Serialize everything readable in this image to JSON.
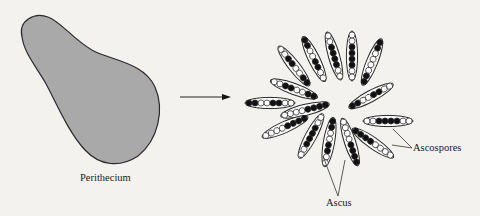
{
  "diagram": {
    "colors": {
      "background": "#f3f2ef",
      "perithecium_fill": "#a9a9a9",
      "outline": "#2a2a2a",
      "spore_dark": "#111111",
      "spore_light": "#ffffff"
    },
    "perithecium": {
      "label": "Perithecium"
    },
    "arrow": {
      "from": [
        180,
        97
      ],
      "to": [
        230,
        97
      ]
    },
    "labels": {
      "ascospores": "Ascospores",
      "ascus": "Ascus"
    },
    "asci": [
      {
        "id": "A",
        "cx": 294,
        "cy": 66,
        "angle": 52,
        "pattern": "WWBBWWBB"
      },
      {
        "id": "B",
        "cx": 314,
        "cy": 59,
        "angle": 64,
        "pattern": "BBWWBBWW"
      },
      {
        "id": "C",
        "cx": 334,
        "cy": 56,
        "angle": 74,
        "pattern": "WWBBBBWW"
      },
      {
        "id": "D",
        "cx": 352,
        "cy": 56,
        "angle": 90,
        "pattern": "WWBBBBWW"
      },
      {
        "id": "E",
        "cx": 372,
        "cy": 62,
        "angle": 112,
        "pattern": "BBWWWWBB"
      },
      {
        "id": "F",
        "cx": 294,
        "cy": 89,
        "angle": 20,
        "pattern": "WWBBWWBB"
      },
      {
        "id": "G",
        "cx": 270,
        "cy": 103,
        "angle": 0,
        "pattern": "BBWWBBWW"
      },
      {
        "id": "H",
        "cx": 305,
        "cy": 110,
        "angle": -14,
        "pattern": "WWWWBBBB"
      },
      {
        "id": "I",
        "cx": 285,
        "cy": 127,
        "angle": -24,
        "pattern": "WWWWBBBB"
      },
      {
        "id": "J",
        "cx": 311,
        "cy": 136,
        "angle": -62,
        "pattern": "WWBBBBWW"
      },
      {
        "id": "K",
        "cx": 329,
        "cy": 142,
        "angle": -80,
        "pattern": "WWBBWWBB"
      },
      {
        "id": "L",
        "cx": 350,
        "cy": 142,
        "angle": 72,
        "pattern": "WWWWBBBB"
      },
      {
        "id": "M",
        "cx": 371,
        "cy": 96,
        "angle": -28,
        "pattern": "BBWWBBWW"
      },
      {
        "id": "N",
        "cx": 388,
        "cy": 121,
        "angle": 0,
        "pattern": "WWBBBBWW"
      },
      {
        "id": "O",
        "cx": 373,
        "cy": 143,
        "angle": 35,
        "pattern": "BBBBWWWW"
      }
    ]
  }
}
